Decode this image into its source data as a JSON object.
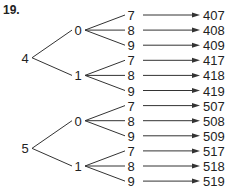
{
  "problem_number": "19.",
  "tree": [
    {
      "digit": "4",
      "children": [
        {
          "digit": "0",
          "leaves": [
            {
              "digit": "7",
              "result": "407"
            },
            {
              "digit": "8",
              "result": "408"
            },
            {
              "digit": "9",
              "result": "409"
            }
          ]
        },
        {
          "digit": "1",
          "leaves": [
            {
              "digit": "7",
              "result": "417"
            },
            {
              "digit": "8",
              "result": "418"
            },
            {
              "digit": "9",
              "result": "419"
            }
          ]
        }
      ]
    },
    {
      "digit": "5",
      "children": [
        {
          "digit": "0",
          "leaves": [
            {
              "digit": "7",
              "result": "507"
            },
            {
              "digit": "8",
              "result": "508"
            },
            {
              "digit": "9",
              "result": "509"
            }
          ]
        },
        {
          "digit": "1",
          "leaves": [
            {
              "digit": "7",
              "result": "517"
            },
            {
              "digit": "8",
              "result": "518"
            },
            {
              "digit": "9",
              "result": "519"
            }
          ]
        }
      ]
    }
  ]
}
